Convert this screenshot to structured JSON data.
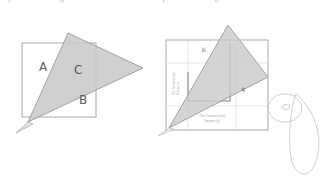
{
  "page": {
    "background_color": "#ffffff",
    "cropped_header_fragment": "p g  o  p   g",
    "width": 326,
    "height": 179
  },
  "palette": {
    "triangle_fill": "#c9c9c9",
    "triangle_stroke": "#9a9a9a",
    "square_stroke": "#9e9e9e",
    "grid_stroke": "#d4d4d4",
    "inner_outline_stroke": "#7c7c7c",
    "label_color": "#5a5a5a",
    "micro_text_color": "#a8a8a8",
    "scroll_stroke": "#c2c2c2"
  },
  "left_figure": {
    "name": "square-with-overlapping-triangle",
    "square": {
      "x": 22,
      "y": 43,
      "width": 74,
      "height": 74
    },
    "triangle_points": "68,33 143,68 28,122",
    "tail_points": "28,122 16,133 33,124",
    "labels": [
      {
        "id": "A",
        "text": "A",
        "x": 39,
        "y": 71
      },
      {
        "id": "C",
        "text": "C",
        "x": 74,
        "y": 74
      },
      {
        "id": "B",
        "text": "B",
        "x": 79,
        "y": 104
      }
    ]
  },
  "right_figure": {
    "name": "gridded-square-with-inscribed-outline-and-triangle",
    "outer_square": {
      "x": 166,
      "y": 40,
      "width": 102,
      "height": 90
    },
    "grid_lines": {
      "vertical_x": [
        188,
        236
      ],
      "horizontal_y": [
        63,
        106
      ]
    },
    "inner_outline_points": "230,43 230,101 188,101 188,72",
    "triangle_points": "228,25 268,77 169,128",
    "labels": [
      {
        "id": "b",
        "text": "b",
        "x": 202,
        "y": 52
      },
      {
        "id": "q",
        "text": "q",
        "x": 241,
        "y": 91
      }
    ],
    "micro_annotations": {
      "vertical_left": {
        "line1": "(P) Construction",
        "line2": "Square b",
        "x": 175,
        "y": 95
      },
      "bottom_caption": {
        "line1": "The Constructing",
        "line2": "Square (a)",
        "x": 212,
        "y": 117
      }
    }
  },
  "scroll_figure": {
    "name": "rolled-tape-scroll",
    "disc": {
      "cx": 285,
      "cy": 108,
      "rx": 17,
      "ry": 14
    },
    "hub": {
      "cx": 286,
      "cy": 107,
      "rx": 4,
      "ry": 2.5
    },
    "loop_path": "M 296,94 C 318,112 325,146 313,168 C 305,180 293,172 291,158 C 288,136 290,110 296,94 Z"
  }
}
